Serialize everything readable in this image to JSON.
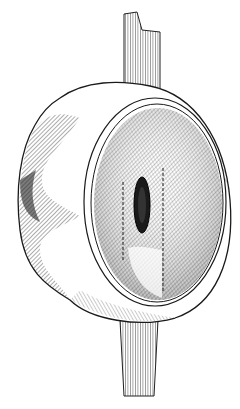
{
  "illustration": {
    "subject": "eyeball-with-optic-nerve",
    "colors": {
      "background": "#ffffff",
      "ink": "#1a1a1a",
      "shade": "#555555"
    }
  }
}
